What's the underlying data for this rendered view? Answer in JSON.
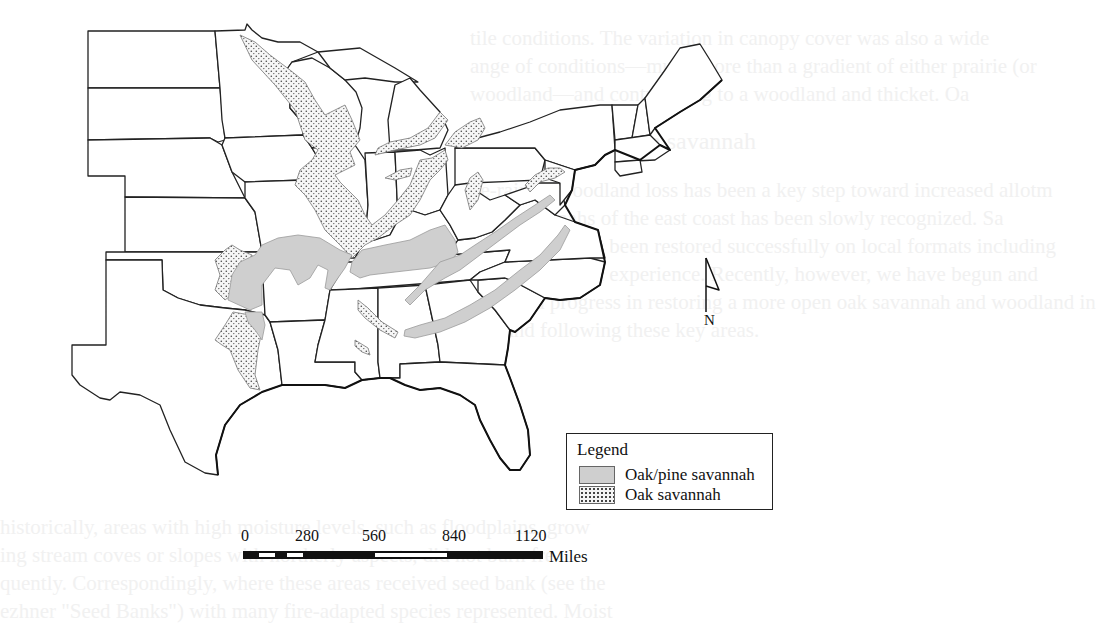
{
  "figure": {
    "type": "map",
    "region": "Eastern and Central United States",
    "features": [
      {
        "id": "oak-pine",
        "label": "Oak/pine savannah",
        "fill": "#cfcfcf",
        "pattern": "solid-gray"
      },
      {
        "id": "oak",
        "label": "Oak savannah",
        "fill": "#f4f4f4",
        "pattern": "stipple-dots"
      }
    ]
  },
  "legend": {
    "title": "Legend",
    "items": [
      {
        "label": "Oak/pine savannah",
        "swatch_color": "#cfcfcf"
      },
      {
        "label": "Oak savannah",
        "swatch_color": "#f4f4f4"
      }
    ]
  },
  "north_arrow": {
    "label": "N"
  },
  "scale_bar": {
    "ticks": [
      "0",
      "280",
      "560",
      "840",
      "1120"
    ],
    "unit": "Miles"
  },
  "background_bleed_text": [
    "tile conditions. The variation in canopy cover was also a wide",
    "ange of conditions—much more than a gradient of either prairie (or",
    "woodland—and contributing to a woodland and thicket. Oa",
    "itiating dynamics in savannah",
    "ne-rain of woodland loss has been a key step toward increased allotm",
    "ants savannahs of the east coast has been slowly recognized. Sa",
    "ss have recently been restored successfully on local formats including",
    "we have limited experience. Recently, however, we have begun and",
    "balanced progress in restoring a more open oak savannah and woodland in",
    "eed and following these key areas.",
    "historically, areas with high moisture levels, such as floodplains, grow",
    "ing stream coves or slopes with northerly aspects, did not burn fre",
    "quently. Correspondingly, where these areas received seed bank (see the",
    "ezhner \"Seed Banks\") with many fire-adapted species represented. Moist"
  ],
  "colors": {
    "outline": "#222222",
    "oak_pine_fill": "#cfcfcf",
    "oak_dot": "#444444",
    "background": "#ffffff"
  }
}
